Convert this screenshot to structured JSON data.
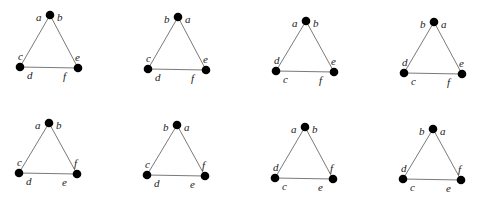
{
  "diagram": {
    "node_color": "#000000",
    "edge_color": "#7a7a7a",
    "panels": [
      {
        "id": "p1",
        "top": [
          50,
          15
        ],
        "bl": [
          20,
          67
        ],
        "br": [
          78,
          68
        ],
        "labels": {
          "top_left": "a",
          "top_right": "b",
          "bl_above": "c",
          "bl_below": "d",
          "br_above": "e",
          "br_below": "f"
        }
      },
      {
        "id": "p2",
        "top": [
          178,
          17
        ],
        "bl": [
          148,
          69
        ],
        "br": [
          206,
          70
        ],
        "labels": {
          "top_left": "b",
          "top_right": "a",
          "bl_above": "c",
          "bl_below": "d",
          "br_above": "e",
          "br_below": "f"
        }
      },
      {
        "id": "p3",
        "top": [
          306,
          21
        ],
        "bl": [
          276,
          71
        ],
        "br": [
          334,
          72
        ],
        "labels": {
          "top_left": "a",
          "top_right": "b",
          "bl_above": "d",
          "bl_below": "c",
          "br_above": "e",
          "br_below": "f"
        }
      },
      {
        "id": "p4",
        "top": [
          434,
          22
        ],
        "bl": [
          404,
          73
        ],
        "br": [
          462,
          74
        ],
        "labels": {
          "top_left": "b",
          "top_right": "a",
          "bl_above": "d",
          "bl_below": "c",
          "br_above": "e",
          "br_below": "f"
        }
      },
      {
        "id": "p5",
        "top": [
          49,
          123
        ],
        "bl": [
          19,
          173
        ],
        "br": [
          77,
          174
        ],
        "labels": {
          "top_left": "a",
          "top_right": "b",
          "bl_above": "c",
          "bl_below": "d",
          "br_above": "f",
          "br_below": "e"
        }
      },
      {
        "id": "p6",
        "top": [
          177,
          125
        ],
        "bl": [
          147,
          175
        ],
        "br": [
          205,
          176
        ],
        "labels": {
          "top_left": "b",
          "top_right": "a",
          "bl_above": "c",
          "bl_below": "d",
          "br_above": "f",
          "br_below": "e"
        }
      },
      {
        "id": "p7",
        "top": [
          305,
          127
        ],
        "bl": [
          275,
          178
        ],
        "br": [
          333,
          179
        ],
        "labels": {
          "top_left": "a",
          "top_right": "b",
          "bl_above": "d",
          "bl_below": "c",
          "br_above": "f",
          "br_below": "e"
        }
      },
      {
        "id": "p8",
        "top": [
          433,
          129
        ],
        "bl": [
          403,
          179
        ],
        "br": [
          461,
          180
        ],
        "labels": {
          "top_left": "b",
          "top_right": "a",
          "bl_above": "d",
          "bl_below": "c",
          "br_above": "f",
          "br_below": "e"
        }
      }
    ]
  }
}
